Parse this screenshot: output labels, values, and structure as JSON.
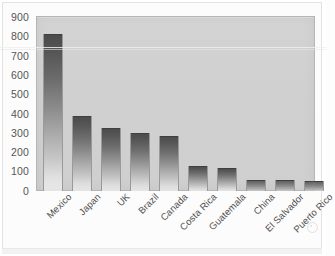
{
  "chart_data": {
    "type": "bar",
    "title": "",
    "subtitle": "",
    "xlabel": "",
    "ylabel": "",
    "ylim": [
      0,
      900
    ],
    "ytick_step": 100,
    "yticks": [
      "900",
      "800",
      "700",
      "600",
      "500",
      "400",
      "300",
      "200",
      "100",
      "0"
    ],
    "grid": false,
    "legend": "none",
    "orientation": "vertical",
    "categories": [
      "Mexico",
      "Japan",
      "UK",
      "Brazil",
      "Canada",
      "Costa Rica",
      "Guatemala",
      "China",
      "El Salvador",
      "Puerto Rico"
    ],
    "values": [
      810,
      390,
      325,
      300,
      285,
      130,
      120,
      55,
      55,
      50
    ],
    "bar_fill": "gradient-dark-to-light",
    "bar_color_top": "#4a4a4a",
    "bar_color_bottom": "#eeeeee",
    "plot_background": "#d1d1d1",
    "page_background": "#fcfcfc"
  },
  "figure": {
    "axis_label_color": "#555555",
    "category_label_rotation_deg": -45
  }
}
